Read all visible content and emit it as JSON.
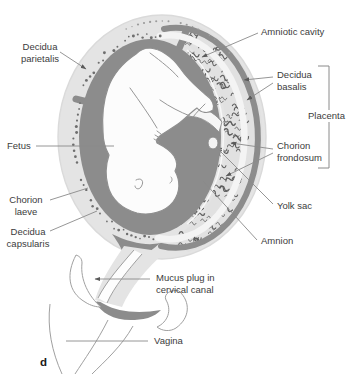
{
  "figure": {
    "panel_letter": "d",
    "colors": {
      "cavity_gray": "#8c8c8c",
      "decidua_light_gray": "#e4e4e4",
      "villi_gray": "#5f5f5f",
      "outline_gray": "#8f8f8f",
      "leader_line_gray": "#8a8a8a",
      "label_text": "#3c3c3c"
    },
    "labels": {
      "decidua_parietalis_1": "Decidua",
      "decidua_parietalis_2": "parietalis",
      "amniotic_cavity": "Amniotic cavity",
      "decidua_basalis_1": "Decidua",
      "decidua_basalis_2": "basalis",
      "placenta": "Placenta",
      "fetus": "Fetus",
      "chorion_frondosum_1": "Chorion",
      "chorion_frondosum_2": "frondosum",
      "chorion_laeve_1": "Chorion",
      "chorion_laeve_2": "laeve",
      "yolk_sac": "Yolk sac",
      "decidua_capsularis_1": "Decidua",
      "decidua_capsularis_2": "capsularis",
      "amnion": "Amnion",
      "mucus_plug_1": "Mucus plug in",
      "mucus_plug_2": "cervical canal",
      "vagina": "Vagina"
    }
  }
}
